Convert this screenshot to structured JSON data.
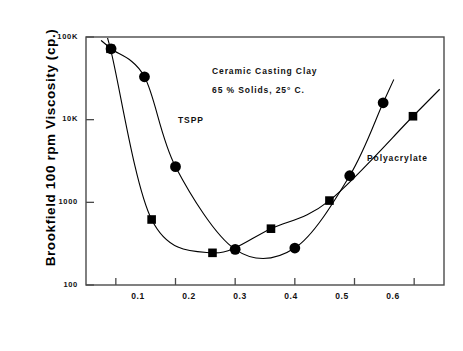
{
  "chart_data": {
    "type": "scatter",
    "title": "",
    "xlabel": "Dispersant Dosage  (%)",
    "ylabel": "Brookfield 100 rpm Viscosity  (cp.)",
    "xlim": [
      0.05,
      0.65
    ],
    "ylim": [
      100,
      100000
    ],
    "yscale": "log",
    "xscale": "linear",
    "grid": false,
    "legend_position": "inline-annotation",
    "xticks": [
      "0.1",
      "0.2",
      "0.3",
      "0.4",
      "0.5",
      "0.6"
    ],
    "xtick_values": [
      0.1,
      0.2,
      0.3,
      0.4,
      0.5,
      0.6
    ],
    "yticks": [
      "100",
      "1000",
      "10K",
      "100K"
    ],
    "ytick_values": [
      100,
      1000,
      10000,
      100000
    ],
    "annotations": [
      "Ceramic Casting Clay",
      "65 % Solids, 25° C."
    ],
    "series": [
      {
        "name": "TSPP",
        "marker": "square",
        "color": "#000000",
        "points": [
          {
            "x": 0.091,
            "y": 72000
          },
          {
            "x": 0.16,
            "y": 620
          },
          {
            "x": 0.262,
            "y": 245
          },
          {
            "x": 0.36,
            "y": 480
          },
          {
            "x": 0.458,
            "y": 1050
          },
          {
            "x": 0.598,
            "y": 11000
          }
        ]
      },
      {
        "name": "Polyacrylate",
        "marker": "circle",
        "color": "#000000",
        "points": [
          {
            "x": 0.092,
            "y": 72000
          },
          {
            "x": 0.148,
            "y": 33000
          },
          {
            "x": 0.2,
            "y": 2700
          },
          {
            "x": 0.3,
            "y": 270
          },
          {
            "x": 0.4,
            "y": 280
          },
          {
            "x": 0.492,
            "y": 2100
          },
          {
            "x": 0.548,
            "y": 16000
          }
        ]
      }
    ]
  },
  "axis": {
    "y_title": "Brookfield 100 rpm Viscosity  (cp.)",
    "x_title": "Dispersant Dosage  (%)",
    "y_labels": [
      "100K",
      "10K",
      "1000",
      "100"
    ],
    "x_labels": [
      "0.1",
      "0.2",
      "0.3",
      "0.4",
      "0.5",
      "0.6"
    ]
  },
  "annotations": {
    "line1": "Ceramic Casting Clay",
    "line2": "65 % Solids, 25° C.",
    "series_tspp": "TSPP",
    "series_polyacrylate": "Polyacrylate"
  }
}
